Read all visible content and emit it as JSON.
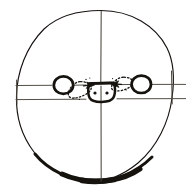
{
  "figure": {
    "caption": "Circle bisected by a vertical axis and crossed by a horizontal band; a central rounded oval with two dots is flanked by two circles, with dotted arrows converging inward.",
    "medium": "pen and ink line drawing",
    "background_color": "#ffffff",
    "ink_color": "#16130f",
    "soft_ink_color": "#4a443c",
    "canvas": {
      "width": 186,
      "height": 193
    }
  },
  "elements": {
    "outer_circle": {
      "name": "outer boundary circle",
      "center_x": 94,
      "center_y": 97,
      "radius_x": 78,
      "radius_y": 87,
      "stroke_width": 1.1,
      "stroke_color": "#16130f",
      "note": "thin hand-drawn outline, slightly irregular"
    },
    "bottom_arc": {
      "name": "thickened bottom arc",
      "stroke_width": 4.2,
      "stroke_color": "#16130f",
      "note": "lower rim drawn heavily, darkest at bottom center"
    },
    "vertical_axis": {
      "name": "vertical midline",
      "x": 101,
      "y_top": 11,
      "y_bottom": 181,
      "stroke_width": 1.0,
      "stroke_color": "#4a443c"
    },
    "horizontal_band": {
      "name": "horizontal equatorial band",
      "upper_line_y": 85,
      "lower_line_y": 99,
      "x_start": 14,
      "x_end": 186,
      "stroke_width": 0.9,
      "stroke_color": "#4a443c",
      "note": "two parallel lines extending beyond the circle on both sides"
    },
    "left_tick": {
      "name": "left edge tick",
      "x": 17,
      "y_top": 80,
      "y_bottom": 101
    },
    "center_body": {
      "name": "central rounded oval",
      "center_x": 101,
      "center_y": 93,
      "width": 28,
      "height": 20,
      "stroke_width": 2.4,
      "stroke_color": "#16130f",
      "dots": [
        {
          "cx": 95,
          "cy": 93,
          "r": 1.6
        },
        {
          "cx": 107,
          "cy": 93,
          "r": 1.6
        }
      ],
      "note": "squarish rounded outline with flat top, two interior dots"
    },
    "satellites": [
      {
        "name": "left satellite circle",
        "center_x": 63,
        "center_y": 85,
        "radius_x": 9.5,
        "radius_y": 8.5,
        "stroke_width": 2.6,
        "stroke_color": "#16130f"
      },
      {
        "name": "right satellite circle",
        "center_x": 141,
        "center_y": 84,
        "radius_x": 9.5,
        "radius_y": 8.5,
        "stroke_width": 2.6,
        "stroke_color": "#16130f"
      }
    ],
    "dotted_paths": [
      {
        "name": "left dotted ellipse",
        "center_x": 80,
        "center_y": 90,
        "radius_x": 11,
        "radius_y": 8,
        "dash": "1.4 2.1",
        "stroke_width": 1.3,
        "direction": "toward center"
      },
      {
        "name": "right dotted ellipse",
        "center_x": 123,
        "center_y": 85,
        "radius_x": 11,
        "radius_y": 7.5,
        "dash": "1.4 2.1",
        "stroke_width": 1.3,
        "direction": "toward center"
      }
    ],
    "arrowheads": [
      {
        "name": "left inward arrowhead",
        "tip_x": 94,
        "tip_y": 85,
        "points_toward": "center",
        "direction_degrees": 0
      },
      {
        "name": "right inward arrowhead",
        "tip_x": 111,
        "tip_y": 84,
        "points_toward": "center",
        "direction_degrees": 180
      }
    ]
  }
}
